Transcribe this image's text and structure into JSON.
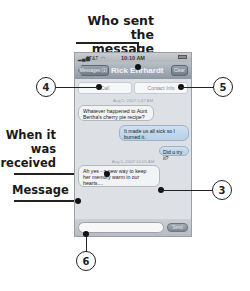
{
  "callouts": {
    "who_sent": [
      "Who sent",
      "the message"
    ],
    "when_received": [
      "When it",
      "was",
      "received"
    ],
    "message": "Message",
    "numbers": {
      "three": "3",
      "four": "4",
      "five": "5",
      "six": "6"
    }
  },
  "phone": {
    "status_bar": {
      "carrier": "AT&T",
      "time": "10:10 AM"
    },
    "nav_bar": {
      "back_button": "Messages (1)",
      "title": "Rick Ehrhardt",
      "clear_button": "Clear"
    },
    "actions": {
      "call": "Call",
      "contact_info": "Contact Info"
    },
    "thread": [
      {
        "type": "timestamp",
        "text": "Aug 5, 2007 5:47 AM"
      },
      {
        "type": "received",
        "text": "Whatever happened to Aunt Bertha's cherry pie recipe?"
      },
      {
        "type": "sent",
        "text": "It made us all sick so I burned it."
      },
      {
        "type": "sent",
        "text": "Did u try it?"
      },
      {
        "type": "timestamp",
        "text": "Aug 5, 2007 10:05 AM"
      },
      {
        "type": "received",
        "text": "Ah yes - a new way to keep her memory warm in our hearts...."
      }
    ],
    "composer": {
      "placeholder": "",
      "send_button": "Send"
    }
  }
}
